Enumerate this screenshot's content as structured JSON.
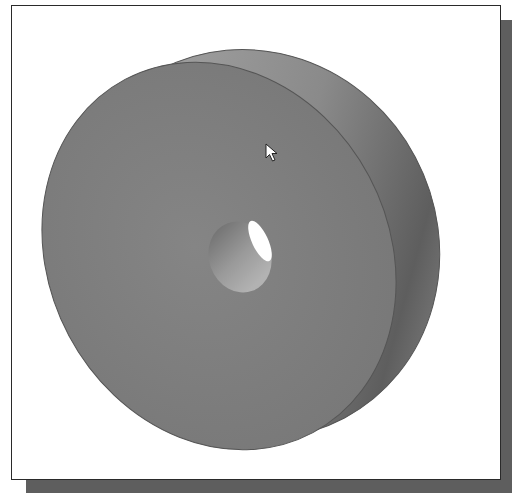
{
  "viewport": {
    "description": "3D shaded model view",
    "model": "disc with center hole",
    "colors": {
      "background": "#ffffff",
      "frame_border": "#2a2a2a",
      "shadow": "#5e5e5e",
      "face": "#808080",
      "rim_light": "#a8a8a8",
      "rim_dark": "#6a6a6a",
      "hole_inner": "#9a9a9a",
      "hole_highlight": "#ffffff"
    }
  },
  "cursor": {
    "icon": "arrow-pointer-icon",
    "x": 265,
    "y": 143
  }
}
